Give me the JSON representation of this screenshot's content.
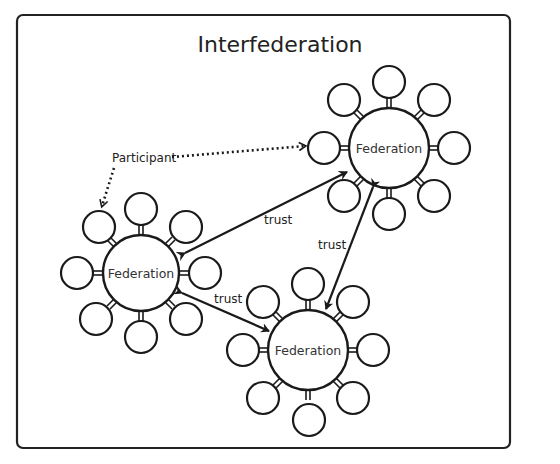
{
  "title": "Interfederation",
  "participant_label": "Participant",
  "federations": [
    {
      "id": "top-right",
      "label": "Federation",
      "cx": 389,
      "cy": 148,
      "r": 40
    },
    {
      "id": "left",
      "label": "Federation",
      "cx": 141,
      "cy": 273,
      "r": 38
    },
    {
      "id": "bottom",
      "label": "Federation",
      "cx": 308,
      "cy": 350,
      "r": 40
    }
  ],
  "satellites_per_federation": 8,
  "trust_links": [
    {
      "from": "left",
      "to": "top-right",
      "label": "trust"
    },
    {
      "from": "top-right",
      "to": "bottom",
      "label": "trust"
    },
    {
      "from": "left",
      "to": "bottom",
      "label": "trust"
    }
  ],
  "colors": {
    "stroke": "#1a1a1a",
    "background": "#ffffff"
  }
}
